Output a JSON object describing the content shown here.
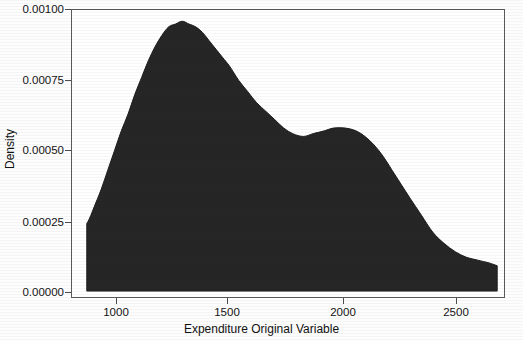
{
  "chart_data": {
    "type": "area",
    "title": "",
    "subtitle": "",
    "xlabel": "Expenditure Original Variable",
    "ylabel": "Density",
    "xlim": [
      867,
      2686
    ],
    "ylim": [
      0.0,
      0.001
    ],
    "grid": false,
    "legend": null,
    "fill_color": "#262626",
    "line_color": "#1c1c1c",
    "axis_color": "#4d4d4d",
    "xticks": [
      1000,
      1500,
      2000,
      2500
    ],
    "xtick_labels": [
      "1000",
      "1500",
      "2000",
      "2500"
    ],
    "yticks": [
      0.0,
      0.00025,
      0.0005,
      0.00075,
      0.001
    ],
    "ytick_labels": [
      "0.00000",
      "0.00025",
      "0.00050",
      "0.00075",
      "0.00100"
    ],
    "annotations": [
      {
        "name": "primary-mode",
        "x": 1290,
        "y": 0.00096
      },
      {
        "name": "local-minimum",
        "x": 1827,
        "y": 0.00055
      },
      {
        "name": "secondary-mode",
        "x": 2013,
        "y": 0.00058
      }
    ],
    "x": [
      867,
      880,
      900,
      930,
      960,
      990,
      1020,
      1050,
      1080,
      1110,
      1140,
      1170,
      1200,
      1230,
      1260,
      1290,
      1320,
      1350,
      1380,
      1410,
      1440,
      1470,
      1500,
      1540,
      1580,
      1620,
      1660,
      1700,
      1740,
      1780,
      1827,
      1870,
      1920,
      1960,
      2013,
      2060,
      2100,
      2140,
      2180,
      2220,
      2260,
      2300,
      2350,
      2400,
      2450,
      2500,
      2550,
      2600,
      2650,
      2686
    ],
    "values": [
      0.00024,
      0.00026,
      0.0003,
      0.00036,
      0.00043,
      0.0005,
      0.00057,
      0.00063,
      0.0007,
      0.00076,
      0.00082,
      0.00087,
      0.00091,
      0.00094,
      0.00095,
      0.00096,
      0.00095,
      0.00094,
      0.00092,
      0.00089,
      0.00086,
      0.00083,
      0.0008,
      0.00075,
      0.00071,
      0.00067,
      0.00064,
      0.00061,
      0.00058,
      0.00056,
      0.00055,
      0.00056,
      0.00057,
      0.00058,
      0.00058,
      0.00057,
      0.00055,
      0.00052,
      0.00048,
      0.00043,
      0.00038,
      0.00033,
      0.00027,
      0.00021,
      0.00017,
      0.00014,
      0.00012,
      0.00011,
      0.0001,
      9e-05
    ]
  },
  "axes": {
    "y_ticks": [
      {
        "label": "0.00100",
        "top": 2
      },
      {
        "label": "0.00075",
        "top": 73
      },
      {
        "label": "0.00050",
        "top": 143
      },
      {
        "label": "0.00025",
        "top": 215
      },
      {
        "label": "0.00000",
        "top": 285
      }
    ],
    "x_ticks": [
      {
        "label": "1000",
        "left": 116
      },
      {
        "label": "1500",
        "left": 227
      },
      {
        "label": "2000",
        "left": 343
      },
      {
        "label": "2500",
        "left": 456
      }
    ]
  }
}
